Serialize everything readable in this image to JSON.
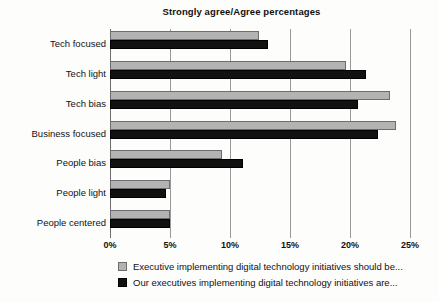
{
  "chart_data": {
    "type": "bar",
    "orientation": "horizontal",
    "title": "Strongly agree/Agree percentages",
    "xlabel": "",
    "ylabel": "",
    "xlim": [
      0,
      25
    ],
    "xticks": [
      "0%",
      "5%",
      "10%",
      "15%",
      "20%",
      "25%"
    ],
    "xtick_values": [
      0,
      5,
      10,
      15,
      20,
      25
    ],
    "grid": true,
    "legend_position": "bottom",
    "categories": [
      "Tech focused",
      "Tech light",
      "Tech bias",
      "Business focused",
      "People bias",
      "People light",
      "People centered"
    ],
    "series": [
      {
        "name": "Executive implementing digital technology initiatives should be...",
        "color": "#b3b3b3",
        "values": [
          12.4,
          19.7,
          23.3,
          23.8,
          9.3,
          5.0,
          5.0
        ]
      },
      {
        "name": "Our executives implementing digital technology initiatives are...",
        "color": "#111111",
        "values": [
          13.2,
          21.3,
          20.7,
          22.3,
          11.1,
          4.7,
          5.0
        ]
      }
    ]
  },
  "legend": {
    "items": [
      {
        "label": "Executive implementing digital technology initiatives should be..."
      },
      {
        "label": "Our executives implementing digital technology initiatives are..."
      }
    ]
  }
}
